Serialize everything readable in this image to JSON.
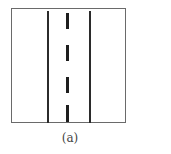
{
  "figure": {
    "caption": "(a)",
    "colors": {
      "border": "#6a6a6a",
      "lines": "#2b2b2b",
      "background": "#ffffff"
    },
    "elements": {
      "outer_box": {
        "x": 11,
        "y": 8,
        "w": 115,
        "h": 115
      },
      "left_solid_line_x": 47,
      "right_solid_line_x": 89,
      "center_dashes": [
        {
          "y": 13,
          "h": 16
        },
        {
          "y": 45,
          "h": 16
        },
        {
          "y": 77,
          "h": 16
        },
        {
          "y": 105,
          "h": 17
        }
      ]
    }
  }
}
